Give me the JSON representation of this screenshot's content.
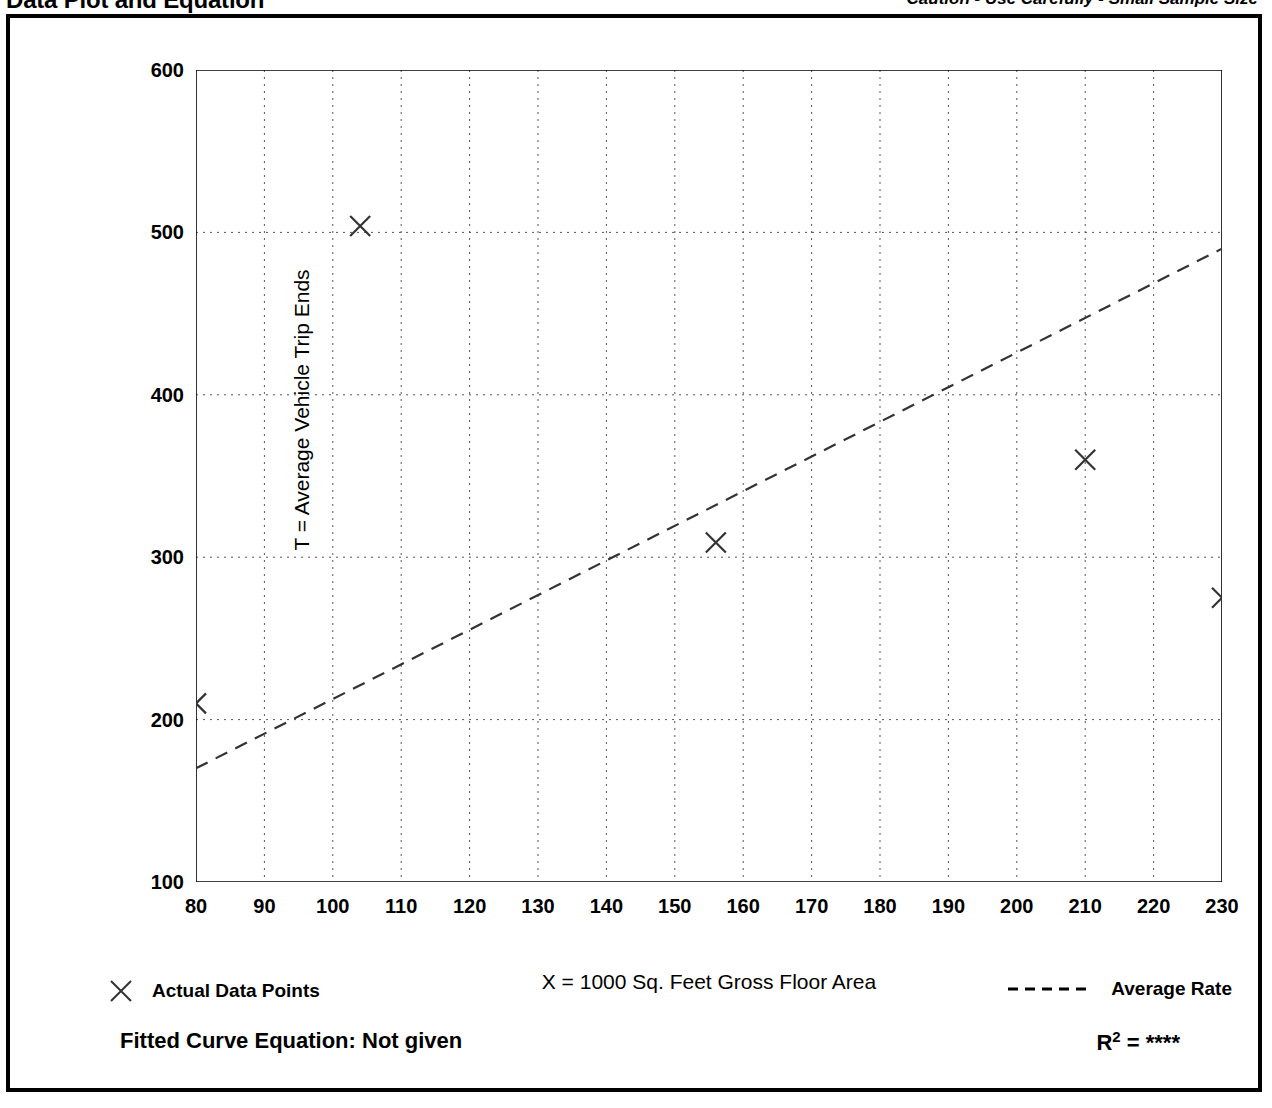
{
  "header": {
    "title": "Data Plot and Equation",
    "caution": "Caution - Use Carefully - Small Sample Size"
  },
  "legend": {
    "data_points_label": "Actual Data Points",
    "average_rate_label": "Average Rate",
    "marker_icon": "x-marker-icon",
    "line_icon": "dashed-line-icon"
  },
  "footer": {
    "equation_label": "Fitted Curve Equation:  Not given",
    "r2_prefix": "R",
    "r2_exponent": "2",
    "r2_value": "= ****"
  },
  "chart_data": {
    "type": "scatter",
    "title": "Data Plot and Equation",
    "xlabel": "X = 1000 Sq. Feet Gross Floor Area",
    "ylabel": "T = Average Vehicle Trip Ends",
    "xlim": [
      80,
      230
    ],
    "ylim": [
      100,
      600
    ],
    "xticks": [
      80,
      90,
      100,
      110,
      120,
      130,
      140,
      150,
      160,
      170,
      180,
      190,
      200,
      210,
      220,
      230
    ],
    "yticks": [
      100,
      200,
      300,
      400,
      500,
      600
    ],
    "y_minor_ticks": [
      150,
      250,
      350,
      450,
      550
    ],
    "grid": "dotted, vertical at every major x tick, horizontal at 200/300/400/500",
    "legend_position": "below-plot",
    "series": [
      {
        "name": "Actual Data Points",
        "type": "scatter",
        "marker": "x",
        "points": [
          {
            "x": 80,
            "y": 210
          },
          {
            "x": 104,
            "y": 504
          },
          {
            "x": 156,
            "y": 309
          },
          {
            "x": 210,
            "y": 360
          },
          {
            "x": 230,
            "y": 275
          }
        ]
      },
      {
        "name": "Average Rate",
        "type": "line",
        "style": "dashed",
        "points": [
          {
            "x": 80,
            "y": 170
          },
          {
            "x": 230,
            "y": 490
          }
        ]
      }
    ]
  },
  "axis": {
    "y_labels": [
      "600",
      "500",
      "400",
      "300",
      "200",
      "100"
    ],
    "x_labels": [
      "80",
      "90",
      "100",
      "110",
      "120",
      "130",
      "140",
      "150",
      "160",
      "170",
      "180",
      "190",
      "200",
      "210",
      "220",
      "230"
    ]
  }
}
